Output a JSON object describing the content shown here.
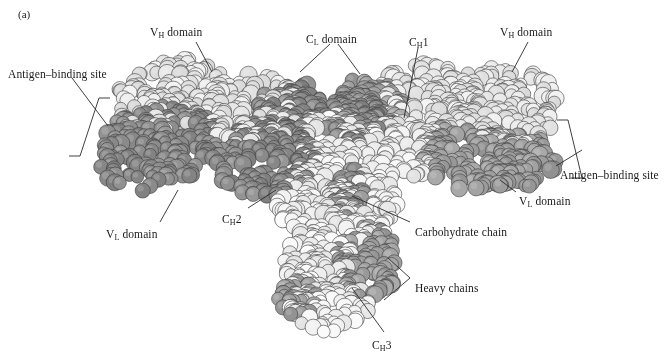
{
  "figure": {
    "panel_label": "(a)",
    "background_color": "#ffffff"
  },
  "palette": {
    "light_chain_dark": "#8a8a8a",
    "light_chain_medium": "#9e9e9e",
    "heavy_chain_light": "#e6e6e6",
    "heavy_chain_pale": "#efefef",
    "carbohydrate": "#909090",
    "sphere_outline": "#4a4a4a",
    "label_color": "#1a1a1a",
    "leader_color": "#2a2a2a"
  },
  "labels": [
    {
      "id": "antigen-binding-site-left",
      "pre": "Antigen–binding site",
      "sub": "",
      "post": "",
      "x": 8,
      "y": 68,
      "anchor": "start"
    },
    {
      "id": "vh-domain-left",
      "pre": "V",
      "sub": "H",
      "post": " domain",
      "x": 150,
      "y": 26,
      "anchor": "start"
    },
    {
      "id": "cl-domain",
      "pre": "C",
      "sub": "L",
      "post": " domain",
      "x": 306,
      "y": 33,
      "anchor": "start"
    },
    {
      "id": "ch1",
      "pre": "C",
      "sub": "H",
      "post": "1",
      "x": 409,
      "y": 36,
      "anchor": "start"
    },
    {
      "id": "vh-domain-right",
      "pre": "V",
      "sub": "H",
      "post": " domain",
      "x": 500,
      "y": 26,
      "anchor": "start"
    },
    {
      "id": "antigen-binding-site-right",
      "pre": "Antigen–binding site",
      "sub": "",
      "post": "",
      "x": 560,
      "y": 169,
      "anchor": "start"
    },
    {
      "id": "vl-domain-right",
      "pre": "V",
      "sub": "L",
      "post": " domain",
      "x": 519,
      "y": 195,
      "anchor": "start"
    },
    {
      "id": "vl-domain-left",
      "pre": "V",
      "sub": "L",
      "post": " domain",
      "x": 106,
      "y": 228,
      "anchor": "start"
    },
    {
      "id": "ch2",
      "pre": "C",
      "sub": "H",
      "post": "2",
      "x": 222,
      "y": 213,
      "anchor": "start"
    },
    {
      "id": "carbohydrate-chain",
      "pre": "Carbohydrate chain",
      "sub": "",
      "post": "",
      "x": 415,
      "y": 226,
      "anchor": "start"
    },
    {
      "id": "heavy-chains",
      "pre": "Heavy chains",
      "sub": "",
      "post": "",
      "x": 415,
      "y": 282,
      "anchor": "start"
    },
    {
      "id": "ch3",
      "pre": "C",
      "sub": "H",
      "post": "3",
      "x": 372,
      "y": 339,
      "anchor": "start"
    }
  ],
  "leader_lines": [
    {
      "id": "leader-vh-left",
      "d": "M 196 42 L 212 72"
    },
    {
      "id": "leader-cl-a",
      "d": "M 330 44 L 300 72"
    },
    {
      "id": "leader-cl-b",
      "d": "M 338 44 L 360 74"
    },
    {
      "id": "leader-ch1",
      "d": "M 418 48 L 404 118"
    },
    {
      "id": "leader-vh-right",
      "d": "M 528 42 L 512 72"
    },
    {
      "id": "leader-vl-right",
      "d": "M 516 192 L 500 180"
    },
    {
      "id": "leader-vl-left",
      "d": "M 160 222 L 178 190"
    },
    {
      "id": "leader-ch2",
      "d": "M 248 208 L 276 190"
    },
    {
      "id": "leader-carbo",
      "d": "M 410 222 L 352 196"
    },
    {
      "id": "leader-heavy-a",
      "d": "M 410 278 L 388 258"
    },
    {
      "id": "leader-heavy-b",
      "d": "M 410 278 L 384 300"
    },
    {
      "id": "leader-ch3",
      "d": "M 384 332 L 352 288"
    },
    {
      "id": "leader-abs-left",
      "d": "M 72 78 L 108 126"
    },
    {
      "id": "leader-abs-right",
      "d": "M 556 166 L 582 150"
    }
  ],
  "brackets": [
    {
      "id": "bracket-antigen-left",
      "d": "M 110 98 L 99 98 L 80 156 L 69 156"
    },
    {
      "id": "bracket-antigen-right",
      "d": "M 557 120 L 568 120 L 582 178 L 571 178"
    }
  ],
  "structure": {
    "description": "Y-shaped immunoglobulin G rendered as overlapping shaded spheres",
    "regions": [
      {
        "name": "left-fab-light-chain",
        "shade": "dark"
      },
      {
        "name": "left-fab-heavy-chain",
        "shade": "light"
      },
      {
        "name": "right-fab-light-chain",
        "shade": "medium"
      },
      {
        "name": "right-fab-heavy-chain",
        "shade": "light"
      },
      {
        "name": "fc-stem-heavy-chains",
        "shade": "light"
      },
      {
        "name": "carbohydrate-chain-spheres",
        "shade": "medium-dark"
      }
    ]
  }
}
